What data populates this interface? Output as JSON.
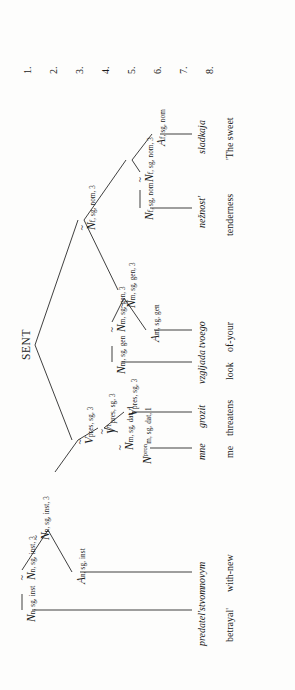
{
  "figure": {
    "kind": "syntactic-dependency-tree",
    "orientation": "rotated-90-ccw",
    "root_label": "SENT",
    "row_numbers": [
      "1.",
      "2.",
      "3.",
      "4.",
      "5.",
      "6.",
      "7.",
      "8."
    ],
    "background_color": "#fdfdfc",
    "ink_color": "#1a1a1a"
  },
  "nodes": {
    "n_root_inst": {
      "cat": "N",
      "tilde": true,
      "sub": "n, sg, inst, 3",
      "row": 2
    },
    "v_tilde_1": {
      "cat": "V",
      "tilde": true,
      "sub": "pres, sg, 3",
      "row": 2
    },
    "v_tilde_sup1": {
      "cat": "V",
      "tilde": true,
      "sup": "1",
      "sub": "pres, sg, 3",
      "row": 3
    },
    "v_plain": {
      "cat": "V",
      "tilde": false,
      "sub": "pres, sg, 3",
      "row": 4
    },
    "n_dat_tilde": {
      "cat": "N",
      "tilde": true,
      "sub": "m, sg, dat, 1",
      "row": 4
    },
    "n_pron_dat": {
      "cat": "N",
      "tilde": false,
      "sup": "pron",
      "sub_stack": [
        "m, sg, dat, 1"
      ],
      "row": 6
    },
    "a_inst": {
      "cat": "A",
      "tilde": false,
      "sub": "n, sg, inst",
      "row": 5
    },
    "n_inst_tilde": {
      "cat": "N",
      "tilde": true,
      "sub": "n, sg, inst, 3",
      "row": 5
    },
    "n_inst_plain": {
      "cat": "N",
      "tilde": false,
      "sub": "n, sg, inst",
      "row": 6
    },
    "n_nom_tilde_hi": {
      "cat": "N",
      "tilde": true,
      "sub": "f, sg, nom, 3",
      "row": 2
    },
    "n_gen_tilde_hi": {
      "cat": "N",
      "tilde": true,
      "sub": "m, sg, gen, 3",
      "row": 4
    },
    "a_gen": {
      "cat": "A",
      "tilde": false,
      "sub": "m, sg, gen",
      "row": 6
    },
    "n_gen_tilde": {
      "cat": "N",
      "tilde": true,
      "sub": "m, sg, gen, 3",
      "row": 5
    },
    "n_gen_plain": {
      "cat": "N",
      "tilde": false,
      "sub": "m, sg, gen",
      "row": 6
    },
    "n_nom_tilde": {
      "cat": "N",
      "tilde": true,
      "sub": "f, sg, nom, 3",
      "row": 4
    },
    "a_nom": {
      "cat": "A",
      "tilde": false,
      "sub": "f, sg, nom",
      "row": 6
    },
    "n_nom_tilde2": {
      "cat": "N",
      "tilde": true,
      "sub": "f, sg, nom, 3",
      "row": 6
    },
    "n_nom_plain": {
      "cat": "N",
      "tilde": false,
      "sub": "f, sg, nom",
      "row": 7
    }
  },
  "words": [
    {
      "id": "w_sladkaja",
      "text": "sladkaja"
    },
    {
      "id": "w_neznost",
      "text": "nežnost'"
    },
    {
      "id": "w_tvoego",
      "text": "tvoego"
    },
    {
      "id": "w_vzgljada",
      "text": "vzgljada"
    },
    {
      "id": "w_grozit",
      "text": "grozit"
    },
    {
      "id": "w_mne",
      "text": "mne"
    },
    {
      "id": "w_novym",
      "text": "novym"
    },
    {
      "id": "w_predatelstvom",
      "text": "predatel'stvom"
    }
  ],
  "glosses": [
    {
      "id": "g_sladkaja",
      "text": "'The sweet"
    },
    {
      "id": "g_neznost",
      "text": "tenderness"
    },
    {
      "id": "g_tvoego",
      "text": "of-your"
    },
    {
      "id": "g_vzgljada",
      "text": "look"
    },
    {
      "id": "g_grozit",
      "text": "threatens"
    },
    {
      "id": "g_mne",
      "text": "me"
    },
    {
      "id": "g_novym",
      "text": "with-new"
    },
    {
      "id": "g_predatelstvom",
      "text": "betrayal'"
    }
  ],
  "labels": {
    "sent": "SENT"
  }
}
